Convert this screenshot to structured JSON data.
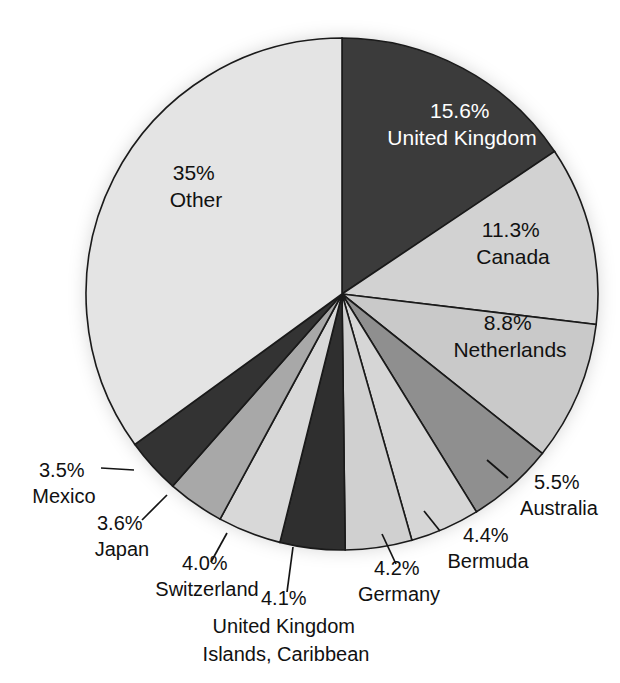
{
  "figure": {
    "background_color": "#ffffff",
    "outline_color": "#1a1a1a"
  },
  "chart_data": {
    "type": "pie",
    "title": "",
    "subtitle": "",
    "xlabel": "",
    "ylabel": "",
    "legend_position": "none",
    "grid": false,
    "units": "percent",
    "start_angle_deg": 0,
    "direction": "clockwise",
    "total_labeled_percent": 100.0,
    "categories": [
      "United Kingdom",
      "Canada",
      "Netherlands",
      "Australia",
      "Bermuda",
      "Germany",
      "United Kingdom Islands, Caribbean",
      "Switzerland",
      "Japan",
      "Mexico",
      "Other"
    ],
    "values": [
      15.6,
      11.3,
      8.8,
      5.5,
      4.4,
      4.2,
      4.1,
      4.0,
      3.6,
      3.5,
      35.0
    ],
    "slices": [
      {
        "index": 0,
        "name": "United Kingdom",
        "percent_label": "15.6%",
        "value": 15.6,
        "color": "#3b3b3b",
        "label_lines": [
          "15.6%",
          "United Kingdom"
        ],
        "label_placement": "inside",
        "label_color": "#ffffff"
      },
      {
        "index": 1,
        "name": "Canada",
        "percent_label": "11.3%",
        "value": 11.3,
        "color": "#d2d2d2",
        "label_lines": [
          "11.3%",
          "Canada"
        ],
        "label_placement": "inside",
        "label_color": "#111111"
      },
      {
        "index": 2,
        "name": "Netherlands",
        "percent_label": "8.8%",
        "value": 8.8,
        "color": "#c9c9c9",
        "label_lines": [
          "8.8%",
          "Netherlands"
        ],
        "label_placement": "inside",
        "label_color": "#111111"
      },
      {
        "index": 3,
        "name": "Australia",
        "percent_label": "5.5%",
        "value": 5.5,
        "color": "#8f8f8f",
        "label_lines": [
          "5.5%",
          "Australia"
        ],
        "label_placement": "outside",
        "label_color": "#111111",
        "has_leader_line": true
      },
      {
        "index": 4,
        "name": "Bermuda",
        "percent_label": "4.4%",
        "value": 4.4,
        "color": "#d6d6d6",
        "label_lines": [
          "4.4%",
          "Bermuda"
        ],
        "label_placement": "outside",
        "label_color": "#111111",
        "has_leader_line": true
      },
      {
        "index": 5,
        "name": "Germany",
        "percent_label": "4.2%",
        "value": 4.2,
        "color": "#d0d0d0",
        "label_lines": [
          "4.2%",
          "Germany"
        ],
        "label_placement": "outside",
        "label_color": "#111111",
        "has_leader_line": true
      },
      {
        "index": 6,
        "name": "United Kingdom Islands, Caribbean",
        "percent_label": "4.1%",
        "value": 4.1,
        "color": "#2f2f2f",
        "label_lines": [
          "4.1%",
          "United Kingdom",
          "Islands, Caribbean"
        ],
        "label_placement": "outside",
        "label_color": "#111111",
        "has_leader_line": true
      },
      {
        "index": 7,
        "name": "Switzerland",
        "percent_label": "4.0%",
        "value": 4.0,
        "color": "#d8d8d8",
        "label_lines": [
          "4.0%",
          "Switzerland"
        ],
        "label_placement": "outside",
        "label_color": "#111111",
        "has_leader_line": true
      },
      {
        "index": 8,
        "name": "Japan",
        "percent_label": "3.6%",
        "value": 3.6,
        "color": "#a8a8a8",
        "label_lines": [
          "3.6%",
          "Japan"
        ],
        "label_placement": "outside",
        "label_color": "#111111",
        "has_leader_line": true
      },
      {
        "index": 9,
        "name": "Mexico",
        "percent_label": "3.5%",
        "value": 3.5,
        "color": "#333333",
        "label_lines": [
          "3.5%",
          "Mexico"
        ],
        "label_placement": "outside",
        "label_color": "#111111",
        "has_leader_line": true
      },
      {
        "index": 10,
        "name": "Other",
        "percent_label": "35%",
        "value": 35.0,
        "color": "#e4e4e4",
        "label_lines": [
          "35%",
          "Other"
        ],
        "label_placement": "inside",
        "label_color": "#111111"
      }
    ]
  },
  "labels": {
    "united_kingdom": {
      "percent": "15.6%",
      "name": "United Kingdom"
    },
    "canada": {
      "percent": "11.3%",
      "name": "Canada"
    },
    "netherlands": {
      "percent": "8.8%",
      "name": "Netherlands"
    },
    "australia": {
      "percent": "5.5%",
      "name": "Australia"
    },
    "bermuda": {
      "percent": "4.4%",
      "name": "Bermuda"
    },
    "germany": {
      "percent": "4.2%",
      "name": "Germany"
    },
    "uk_islands": {
      "percent": "4.1%",
      "name_line1": "United Kingdom",
      "name_line2": "Islands, Caribbean"
    },
    "switzerland": {
      "percent": "4.0%",
      "name": "Switzerland"
    },
    "japan": {
      "percent": "3.6%",
      "name": "Japan"
    },
    "mexico": {
      "percent": "3.5%",
      "name": "Mexico"
    },
    "other": {
      "percent": "35%",
      "name": "Other"
    }
  }
}
